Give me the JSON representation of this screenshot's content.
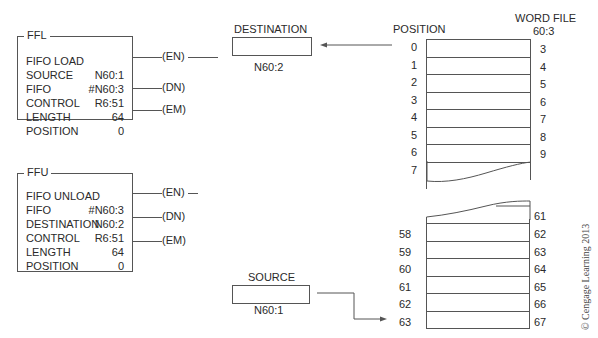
{
  "ffl": {
    "title": "FFL",
    "rows": [
      {
        "label": "FIFO LOAD",
        "value": ""
      },
      {
        "label": "SOURCE",
        "value": "N60:1"
      },
      {
        "label": "FIFO",
        "value": "#N60:3"
      },
      {
        "label": "CONTROL",
        "value": "R6:51"
      },
      {
        "label": "LENGTH",
        "value": "64"
      },
      {
        "label": "POSITION",
        "value": "0"
      }
    ],
    "coils": [
      "EN",
      "DN",
      "EM"
    ]
  },
  "ffu": {
    "title": "FFU",
    "rows": [
      {
        "label": "FIFO UNLOAD",
        "value": ""
      },
      {
        "label": "FIFO",
        "value": "#N60:3"
      },
      {
        "label": "DESTINATION",
        "value": "N60:2"
      },
      {
        "label": "CONTROL",
        "value": "R6:51"
      },
      {
        "label": "LENGTH",
        "value": "64"
      },
      {
        "label": "POSITION",
        "value": "0"
      }
    ],
    "coils": [
      "EN",
      "DN",
      "EM"
    ]
  },
  "destination": {
    "label": "DESTINATION",
    "address": "N60:2"
  },
  "source": {
    "label": "SOURCE",
    "address": "N60:1"
  },
  "word_file": {
    "position_header": "POSITION",
    "file_header": "WORD FILE",
    "file_address": "60:3",
    "top_positions": [
      "0",
      "1",
      "2",
      "3",
      "4",
      "5",
      "6",
      "7"
    ],
    "top_words": [
      "3",
      "4",
      "5",
      "6",
      "7",
      "8",
      "9"
    ],
    "bottom_positions": [
      "58",
      "59",
      "60",
      "61",
      "62",
      "63"
    ],
    "bottom_words": [
      "61",
      "62",
      "63",
      "64",
      "65",
      "66",
      "67"
    ]
  },
  "copyright": "© Cengage Learning 2013"
}
